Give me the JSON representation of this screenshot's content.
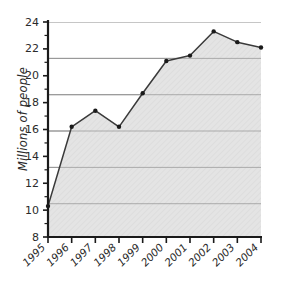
{
  "chart_data": {
    "type": "area",
    "title": "",
    "subtitle": "",
    "xlabel": "",
    "ylabel": "Millions of people",
    "categories": [
      "1995",
      "1996",
      "1997",
      "1998",
      "1999",
      "2000",
      "2001",
      "2002",
      "2003",
      "2004"
    ],
    "values": [
      10.3,
      16.2,
      17.4,
      16.2,
      18.7,
      21.1,
      21.5,
      23.3,
      22.5,
      22.1
    ],
    "series": [
      {
        "name": "Millions of people",
        "values": [
          10.3,
          16.2,
          17.4,
          16.2,
          18.7,
          21.1,
          21.5,
          23.3,
          22.5,
          22.1
        ]
      }
    ],
    "ylim": [
      8,
      24
    ],
    "ytick_labels": [
      "8",
      "10",
      "12",
      "14",
      "16",
      "18",
      "20",
      "22",
      "24"
    ],
    "ytick_values": [
      8,
      10,
      12,
      14,
      16,
      18,
      20,
      22,
      24
    ],
    "xtick_labels": [
      "1995",
      "1996",
      "1997",
      "1998",
      "1999",
      "2000",
      "2001",
      "2002",
      "2003",
      "2004"
    ],
    "grid": true,
    "gridlines_at": [
      10.7,
      13.4,
      16.1,
      18.6,
      21.3,
      24.0
    ],
    "legend": "none",
    "legend_position": "none",
    "marker": "filled-circle",
    "annotations": [],
    "colors": {
      "area_fill": "#e2e2e2",
      "line": "#3a3a3a",
      "marker": "#1a1a1a",
      "axis": "#1a1a1a",
      "grid": "#8d8d8d",
      "text": "#2b2b2b",
      "background": "#ffffff"
    }
  }
}
